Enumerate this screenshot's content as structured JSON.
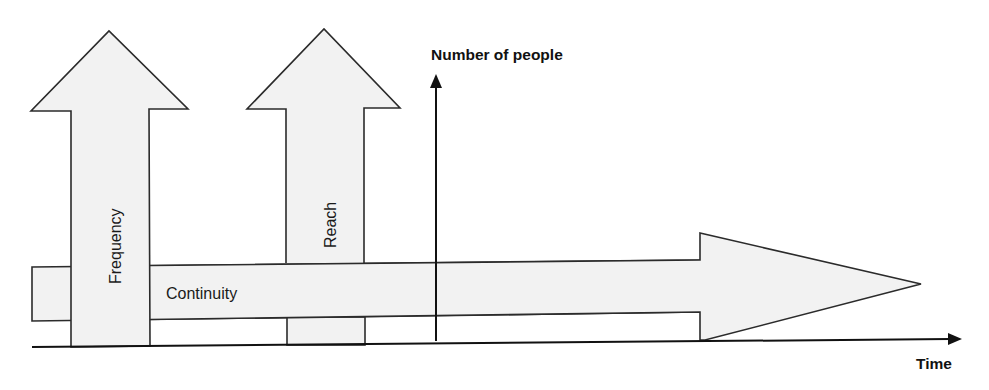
{
  "diagram": {
    "y_axis": {
      "label": "Number of people"
    },
    "x_axis": {
      "label": "Time"
    },
    "arrows": [
      {
        "id": "frequency",
        "label": "Frequency",
        "direction": "up"
      },
      {
        "id": "reach",
        "label": "Reach",
        "direction": "up"
      },
      {
        "id": "continuity",
        "label": "Continuity",
        "direction": "right"
      }
    ]
  },
  "colors": {
    "arrow_fill": "#f2f2f2",
    "arrow_stroke": "#2b2b2b",
    "axis": "#111111",
    "background": "#ffffff"
  }
}
